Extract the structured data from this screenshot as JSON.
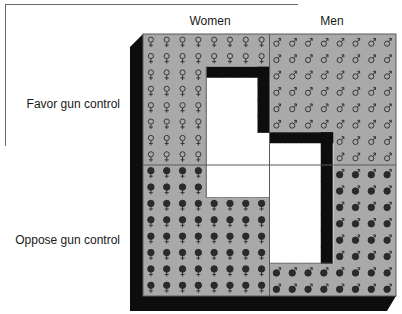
{
  "chart_data": {
    "type": "table",
    "title": "",
    "columns": [
      "Women",
      "Men"
    ],
    "rows": [
      "Favor gun control",
      "Oppose gun control"
    ],
    "cells": [
      {
        "gender": "Women",
        "opinion": "Favor gun control",
        "count": 40,
        "symbol": "female-outline"
      },
      {
        "gender": "Women",
        "opinion": "Oppose gun control",
        "count": 56,
        "symbol": "female-filled"
      },
      {
        "gender": "Men",
        "opinion": "Favor gun control",
        "count": 56,
        "symbol": "male-outline"
      },
      {
        "gender": "Men",
        "opinion": "Oppose gun control",
        "count": 40,
        "symbol": "male-filled"
      }
    ],
    "grid": {
      "cols_per_gender": 8,
      "rows_per_opinion": 8
    }
  },
  "labels": {
    "women": "Women",
    "men": "Men",
    "favor": "Favor gun control",
    "oppose": "Oppose gun control"
  },
  "colors": {
    "panel": "#a9a9a9",
    "shadow": "#0d0d0d",
    "hole": "#ffffff",
    "symbol": "#2a2a2a",
    "divider": "#5a5a5a"
  }
}
